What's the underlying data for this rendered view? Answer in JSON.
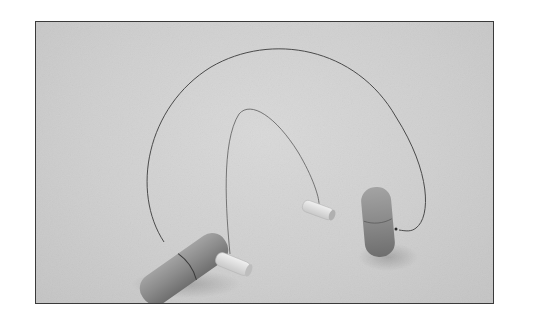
{
  "image": {
    "description": "Two wire cheese/clay cutting tools on a plain gray surface: a large one with thick wooden handles and a small one with light-colored dowel handles",
    "colors": {
      "background": "#ffffff",
      "surface": "#d2d2d2",
      "frame_border": "#3a3a3a",
      "wood_dark": "#8a8a8a",
      "wood_light": "#e4e4e4",
      "wire": "#4a4a4a"
    },
    "objects": [
      {
        "name": "large-cutter-left-handle",
        "type": "wooden handle"
      },
      {
        "name": "large-cutter-right-handle",
        "type": "wooden handle"
      },
      {
        "name": "large-cutter-wire",
        "type": "wire arc"
      },
      {
        "name": "small-cutter-left-handle",
        "type": "light dowel handle"
      },
      {
        "name": "small-cutter-right-handle",
        "type": "light dowel handle"
      },
      {
        "name": "small-cutter-wire",
        "type": "wire arc"
      }
    ]
  }
}
